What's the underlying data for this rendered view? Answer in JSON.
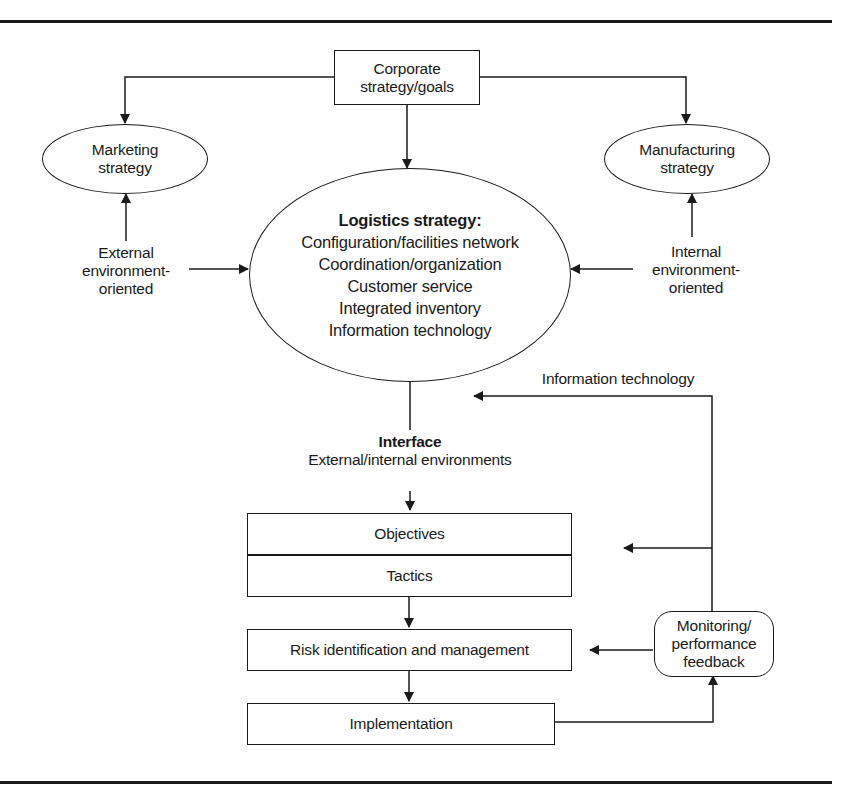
{
  "diagram": {
    "corporate": {
      "line1": "Corporate",
      "line2": "strategy/goals"
    },
    "marketing": {
      "line1": "Marketing",
      "line2": "strategy"
    },
    "manufacturing": {
      "line1": "Manufacturing",
      "line2": "strategy"
    },
    "external": {
      "line1": "External",
      "line2": "environment-",
      "line3": "oriented"
    },
    "internal": {
      "line1": "Internal",
      "line2": "environment-",
      "line3": "oriented"
    },
    "logistics": {
      "title": "Logistics strategy:",
      "items": [
        "Configuration/facilities network",
        "Coordination/organization",
        "Customer service",
        "Integrated inventory",
        "Information technology"
      ]
    },
    "info_tech_label": "Information technology",
    "interface": {
      "title": "Interface",
      "subtitle": "External/internal environments"
    },
    "objectives": "Objectives",
    "tactics": "Tactics",
    "risk": "Risk identification and management",
    "implementation": "Implementation",
    "monitoring": {
      "line1": "Monitoring/",
      "line2": "performance",
      "line3": "feedback"
    }
  }
}
